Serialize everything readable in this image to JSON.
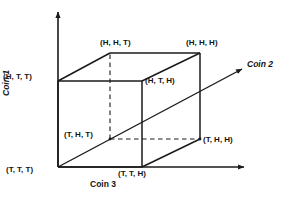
{
  "figure": {
    "type": "diagram",
    "width": 287,
    "height": 198,
    "background_color": "#ffffff",
    "line_color": "#1a1a1a",
    "text_color": "#141414"
  },
  "axes": {
    "coin1": {
      "label": "Coin 1",
      "orientation": "vertical",
      "rotation_deg": -90,
      "arrow": "up"
    },
    "coin2": {
      "label": "Coin 2",
      "orientation": "diagonal",
      "arrow": "up-right"
    },
    "coin3": {
      "label": "Coin 3",
      "orientation": "horizontal",
      "arrow": "right"
    }
  },
  "vertices": [
    {
      "id": "TTT",
      "label": "(T, T, T)",
      "coin1": "T",
      "coin2": "T",
      "coin3": "T",
      "x": 58,
      "y": 167,
      "hidden": false
    },
    {
      "id": "TTH",
      "label": "(T, T, H)",
      "coin1": "T",
      "coin2": "T",
      "coin3": "H",
      "x": 142,
      "y": 167,
      "hidden": false
    },
    {
      "id": "HTT",
      "label": "(H, T, T)",
      "coin1": "H",
      "coin2": "T",
      "coin3": "T",
      "x": 58,
      "y": 81,
      "hidden": false
    },
    {
      "id": "HTH",
      "label": "(H, T, H)",
      "coin1": "H",
      "coin2": "T",
      "coin3": "H",
      "x": 142,
      "y": 81,
      "hidden": false
    },
    {
      "id": "THT",
      "label": "(T, H, T)",
      "coin1": "T",
      "coin2": "H",
      "coin3": "T",
      "x": 110,
      "y": 139,
      "hidden": true
    },
    {
      "id": "THH",
      "label": "(T, H, H)",
      "coin1": "T",
      "coin2": "H",
      "coin3": "H",
      "x": 200,
      "y": 139,
      "hidden": false
    },
    {
      "id": "HHT",
      "label": "(H, H, T)",
      "coin1": "H",
      "coin2": "H",
      "coin3": "T",
      "x": 110,
      "y": 53,
      "hidden": false
    },
    {
      "id": "HHH",
      "label": "(H, H, H)",
      "coin1": "H",
      "coin2": "H",
      "coin3": "H",
      "x": 200,
      "y": 53,
      "hidden": false
    }
  ],
  "edges": [
    {
      "from": "TTT",
      "to": "TTH",
      "style": "solid"
    },
    {
      "from": "TTT",
      "to": "HTT",
      "style": "solid"
    },
    {
      "from": "TTH",
      "to": "HTH",
      "style": "solid"
    },
    {
      "from": "HTT",
      "to": "HTH",
      "style": "solid"
    },
    {
      "from": "HHT",
      "to": "HHH",
      "style": "solid"
    },
    {
      "from": "HHH",
      "to": "THH",
      "style": "solid"
    },
    {
      "from": "THH",
      "to": "TTH",
      "style": "solid"
    },
    {
      "from": "HTT",
      "to": "HHT",
      "style": "solid"
    },
    {
      "from": "HTH",
      "to": "HHH",
      "style": "solid"
    },
    {
      "from": "THT",
      "to": "HHT",
      "style": "dashed"
    },
    {
      "from": "THT",
      "to": "THH",
      "style": "dashed"
    },
    {
      "from": "THT",
      "to": "TTT",
      "style": "solid"
    }
  ],
  "icons": {
    "coin2_arrow": "arrow-up-right-icon",
    "coin3_arrow": "arrow-right-icon",
    "coin1_arrow": "arrow-up-icon"
  }
}
